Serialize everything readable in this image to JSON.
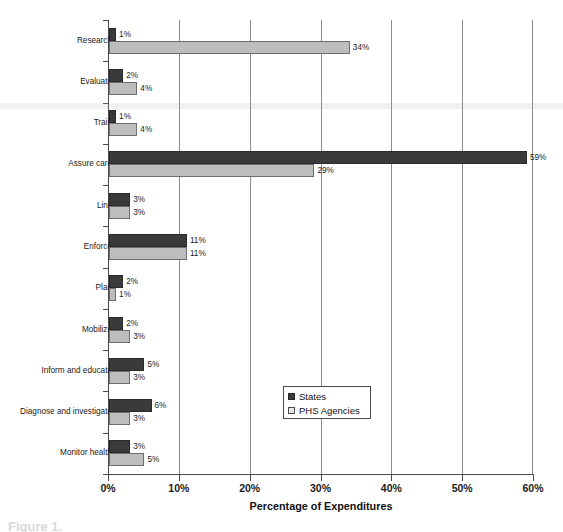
{
  "chart_data": {
    "type": "bar",
    "orientation": "horizontal",
    "title": "",
    "xlabel": "Percentage of Expenditures",
    "ylabel": "",
    "xlim": [
      0,
      60
    ],
    "xticks": [
      "0%",
      "10%",
      "20%",
      "30%",
      "40%",
      "50%",
      "60%"
    ],
    "grid": true,
    "legend_position": "inside-right-lower",
    "categories": [
      "Research",
      "Evaluate",
      "Train",
      "Assure care",
      "Link",
      "Enforce",
      "Plan",
      "Mobilize",
      "Inform and educate",
      "Diagnose and investigate",
      "Monitor health"
    ],
    "series": [
      {
        "name": "States",
        "color": "#3a3a3a",
        "values": [
          1,
          2,
          1,
          59,
          3,
          11,
          2,
          2,
          5,
          6,
          3
        ],
        "labels": [
          "1%",
          "2%",
          "1%",
          "59%",
          "3%",
          "11%",
          "2%",
          "2%",
          "5%",
          "6%",
          "3%"
        ]
      },
      {
        "name": "PHS Agencies",
        "color": "#bdbdbd",
        "values": [
          34,
          4,
          4,
          29,
          3,
          11,
          1,
          3,
          3,
          3,
          5
        ],
        "labels": [
          "34%",
          "4%",
          "4%",
          "29%",
          "3%",
          "11%",
          "1%",
          "3%",
          "3%",
          "3%",
          "5%"
        ]
      }
    ]
  },
  "legend": {
    "items": [
      {
        "label": "States",
        "swatch": "dark"
      },
      {
        "label": "PHS Agencies",
        "swatch": "light"
      }
    ]
  },
  "axis": {
    "x_title": "Percentage of Expenditures"
  },
  "caption": {
    "text": "Figure 1."
  }
}
